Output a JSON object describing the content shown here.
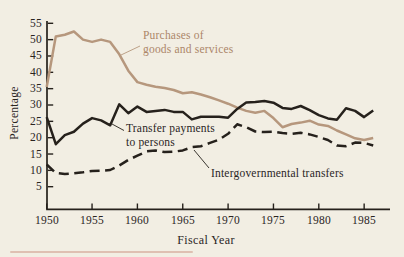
{
  "figure": {
    "background_color": "#f2eee3",
    "ink_color": "#26211c",
    "accent_color": "#b6977d",
    "accent_text_color": "#ac8669",
    "bottom_rule_color": "#d8b0a2"
  },
  "labels": {
    "ylabel": "Percentage",
    "xlabel": "Fiscal Year",
    "purchases_line1": "Purchases of",
    "purchases_line2": "goods and services",
    "transfer_line1": "Transfer payments",
    "transfer_line2": "to persons",
    "intergovernmental": "Intergovernmental transfers"
  },
  "chart_data": {
    "type": "line",
    "title": "",
    "xlabel": "Fiscal Year",
    "ylabel": "Percentage",
    "grid": false,
    "legend_position": "inline-annotations",
    "x_range": [
      1950,
      1986
    ],
    "ylim": [
      5,
      55
    ],
    "y_ticks": [
      "55",
      "50",
      "45",
      "40",
      "35",
      "30",
      "25",
      "20",
      "15",
      "10",
      "5"
    ],
    "x_ticks": [
      "1950",
      "1955",
      "1960",
      "1965",
      "1970",
      "1975",
      "1980",
      "1985"
    ],
    "x": [
      1950,
      1951,
      1952,
      1953,
      1954,
      1955,
      1956,
      1957,
      1958,
      1959,
      1960,
      1961,
      1962,
      1963,
      1964,
      1965,
      1966,
      1967,
      1968,
      1969,
      1970,
      1971,
      1972,
      1973,
      1974,
      1975,
      1976,
      1977,
      1978,
      1979,
      1980,
      1981,
      1982,
      1983,
      1984,
      1985,
      1986
    ],
    "series": [
      {
        "name": "Purchases of goods and services",
        "style": "solid",
        "color": "#b6977d",
        "values": [
          35.5,
          51.0,
          51.5,
          52.5,
          50.0,
          49.3,
          50.0,
          49.3,
          45.5,
          40.5,
          37.0,
          36.2,
          35.6,
          35.2,
          34.6,
          33.6,
          33.9,
          33.2,
          32.4,
          31.4,
          30.4,
          29.2,
          28.2,
          27.6,
          28.2,
          26.0,
          23.2,
          24.2,
          24.6,
          25.2,
          24.0,
          23.6,
          22.2,
          21.0,
          19.8,
          19.3,
          19.9
        ]
      },
      {
        "name": "Transfer payments to persons",
        "style": "solid",
        "color": "#26211c",
        "values": [
          26.3,
          18.0,
          20.8,
          21.8,
          24.3,
          26.0,
          25.3,
          23.8,
          30.2,
          27.5,
          29.5,
          27.9,
          28.2,
          28.5,
          27.9,
          27.9,
          25.6,
          26.4,
          26.4,
          26.4,
          26.1,
          28.8,
          30.8,
          30.9,
          31.2,
          30.7,
          29.1,
          28.8,
          29.7,
          28.4,
          26.9,
          25.9,
          25.5,
          29.0,
          28.2,
          26.3,
          28.3
        ]
      },
      {
        "name": "Intergovernmental transfers",
        "style": "dashed",
        "color": "#26211c",
        "values": [
          11.8,
          9.2,
          8.9,
          9.1,
          9.4,
          9.8,
          9.9,
          10.1,
          11.5,
          13.2,
          14.5,
          15.8,
          16.1,
          15.6,
          15.7,
          16.1,
          17.1,
          17.4,
          18.4,
          19.4,
          21.2,
          24.1,
          23.2,
          21.9,
          21.7,
          21.8,
          21.4,
          21.2,
          21.5,
          21.0,
          20.2,
          19.3,
          17.6,
          17.4,
          18.5,
          18.4,
          17.6
        ]
      }
    ]
  }
}
